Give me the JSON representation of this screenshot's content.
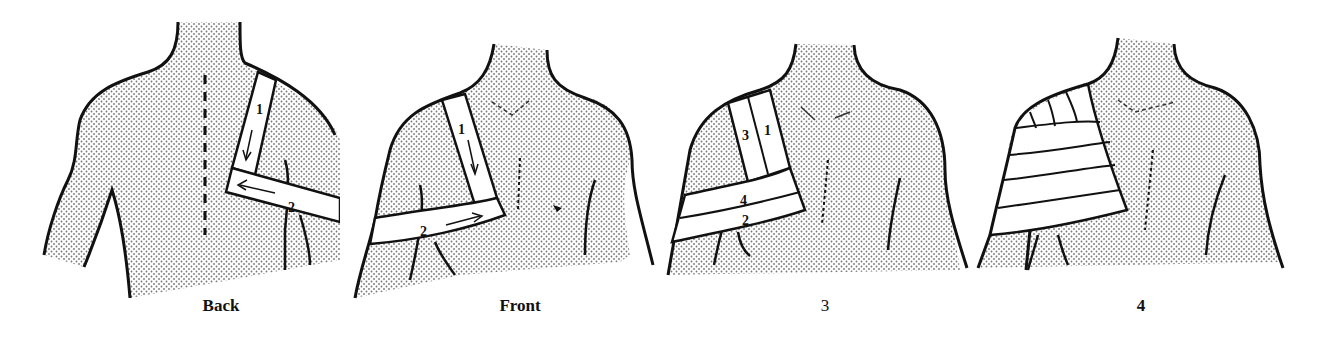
{
  "figure": {
    "colors": {
      "skin_dots": "#777777",
      "outline": "#111111",
      "tape": "#ffffff",
      "background": "#ffffff"
    },
    "panels": [
      {
        "caption": "Back",
        "view": "back",
        "strips": [
          {
            "label": "1",
            "direction": "down"
          },
          {
            "label": "2",
            "direction": "left"
          }
        ],
        "features": [
          "dashed spine line"
        ]
      },
      {
        "caption": "Front",
        "view": "front",
        "strips": [
          {
            "label": "1",
            "direction": "down"
          },
          {
            "label": "2",
            "direction": "right"
          }
        ],
        "features": [
          "clavicle marks",
          "sternum stitches",
          "nipple marks"
        ]
      },
      {
        "caption": "3",
        "view": "front",
        "strips": [
          {
            "label": "3"
          },
          {
            "label": "1"
          },
          {
            "label": "4"
          },
          {
            "label": "2"
          }
        ],
        "features": [
          "clavicle marks",
          "sternum stitches"
        ]
      },
      {
        "caption": "4",
        "view": "front",
        "strips": [],
        "features": [
          "complete spica wrap over shoulder",
          "clavicle marks",
          "sternum stitches"
        ]
      }
    ]
  }
}
